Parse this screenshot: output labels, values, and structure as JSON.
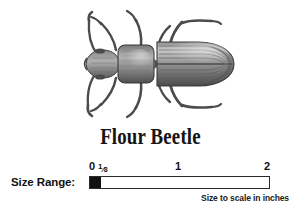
{
  "specimen": {
    "common_name": "Flour Beetle",
    "illustration": "beetle-dorsal-engraving"
  },
  "size_range": {
    "label": "Size Range:",
    "unit_note": "Size to scale in inches",
    "axis_min": 0,
    "axis_max": 2,
    "filled_from": 0,
    "filled_to": 0.125,
    "ticks": [
      {
        "value": 0,
        "label": "0"
      },
      {
        "value": 0.125,
        "label": "1/8",
        "numerator": "1",
        "denominator": "8"
      },
      {
        "value": 1,
        "label": "1"
      },
      {
        "value": 2,
        "label": "2"
      }
    ]
  },
  "colors": {
    "background": "#ffffff",
    "ink": "#111111",
    "rule": "#2a2a2a",
    "illustration_dark": "#3a3a3a",
    "illustration_mid": "#6e6e6e",
    "illustration_light": "#a8a8a8"
  }
}
